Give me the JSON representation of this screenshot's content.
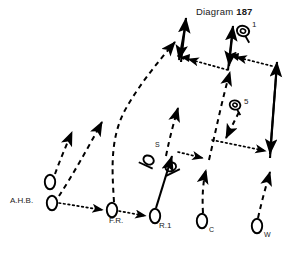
{
  "diagram": {
    "title_prefix": "Diagram",
    "title_number": "187",
    "type": "sports-play-diagram",
    "background_color": "#ffffff",
    "ink_color": "#000000",
    "width": 294,
    "height": 254,
    "players": [
      {
        "id": "ahb-upper",
        "label": "",
        "x": 50,
        "y": 182,
        "shape": "oval"
      },
      {
        "id": "ahb",
        "label": "A.H.B.",
        "label_x": 10,
        "label_y": 196,
        "x": 52,
        "y": 203,
        "shape": "oval"
      },
      {
        "id": "fr",
        "label": "F.R.",
        "label_x": 110,
        "label_y": 218,
        "x": 112,
        "y": 210,
        "shape": "oval"
      },
      {
        "id": "r1",
        "label": "R.1",
        "label_x": 160,
        "label_y": 224,
        "x": 155,
        "y": 216,
        "shape": "oval"
      },
      {
        "id": "c",
        "label": "C",
        "label_x": 210,
        "label_y": 229,
        "x": 202,
        "y": 221,
        "shape": "oval"
      },
      {
        "id": "w",
        "label": "W",
        "label_x": 265,
        "label_y": 234,
        "x": 257,
        "y": 226,
        "shape": "oval"
      }
    ],
    "opponents": [
      {
        "id": "s-left",
        "label": "",
        "x": 147,
        "y": 163,
        "shape": "tilted-oval-with-bar"
      },
      {
        "id": "s-right",
        "label": "S",
        "label_x": 157,
        "label_y": 148,
        "x": 172,
        "y": 170,
        "shape": "tilted-oval-with-bar"
      }
    ],
    "balls": [
      {
        "id": "ball-1",
        "label": "1",
        "x": 243,
        "y": 31,
        "label_x": 253,
        "label_y": 25
      },
      {
        "id": "ball-5",
        "label": "5",
        "x": 235,
        "y": 105,
        "label_x": 245,
        "label_y": 102
      }
    ],
    "legend_hints": {
      "dashed": "player run",
      "dotted": "pass / ball path",
      "solid": "drive"
    }
  }
}
